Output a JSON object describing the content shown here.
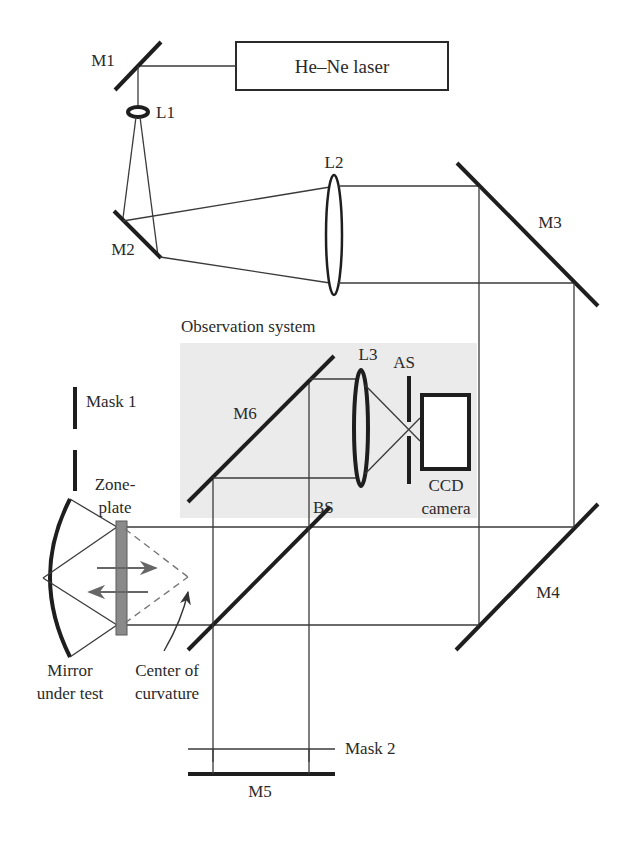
{
  "diagram": {
    "source": {
      "label": "He–Ne laser"
    },
    "mirrors": {
      "m1": "M1",
      "m2": "M2",
      "m3": "M3",
      "m4": "M4",
      "m5": "M5",
      "m6": "M6"
    },
    "lenses": {
      "l1": "L1",
      "l2": "L2",
      "l3": "L3"
    },
    "observation_system": {
      "label": "Observation system",
      "aperture_stop": "AS",
      "camera_line1": "CCD",
      "camera_line2": "camera",
      "background_color": "#ebebeb"
    },
    "beam_splitter": "BS",
    "masks": {
      "mask1": "Mask 1",
      "mask2": "Mask 2"
    },
    "zone_plate": {
      "line1": "Zone-",
      "line2": "plate",
      "color": "#8a8a8a"
    },
    "mirror_under_test": {
      "line1": "Mirror",
      "line2": "under test"
    },
    "center_of_curvature": {
      "line1": "Center of",
      "line2": "curvature"
    }
  }
}
